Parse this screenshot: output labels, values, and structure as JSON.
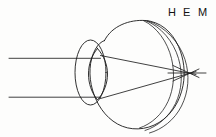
{
  "figure": {
    "background_color": "#fdfdfc",
    "line_color": "#1a1a1a",
    "width": 216,
    "height": 137
  },
  "labels": [
    {
      "id": "H",
      "text": "H",
      "meaning": "hypermetropia",
      "x": 168,
      "y": 7
    },
    {
      "id": "E",
      "text": "E",
      "meaning": "emmetropia",
      "x": 183,
      "y": 7
    },
    {
      "id": "M",
      "text": "M",
      "meaning": "myopia",
      "x": 198,
      "y": 7
    }
  ],
  "optics": {
    "incoming_ray_top_y": 58,
    "incoming_ray_bottom_y": 97,
    "incoming_ray_start_x": 9,
    "focal_point_x": 190,
    "focal_point_y": 73,
    "lens_top_y": 48,
    "lens_bottom_y": 100,
    "lens_left_x": 88,
    "lens_right_x": 107
  },
  "parts": [
    {
      "name": "eyeball-globe",
      "label": "globe"
    },
    {
      "name": "anterior-chamber-circle",
      "label": "cornea / anterior chamber"
    },
    {
      "name": "crystalline-lens",
      "label": "crystalline lens"
    },
    {
      "name": "retina-arc-h",
      "label": "retina plane H"
    },
    {
      "name": "retina-arc-e",
      "label": "retina plane E"
    },
    {
      "name": "retina-arc-m",
      "label": "retina plane M"
    }
  ]
}
